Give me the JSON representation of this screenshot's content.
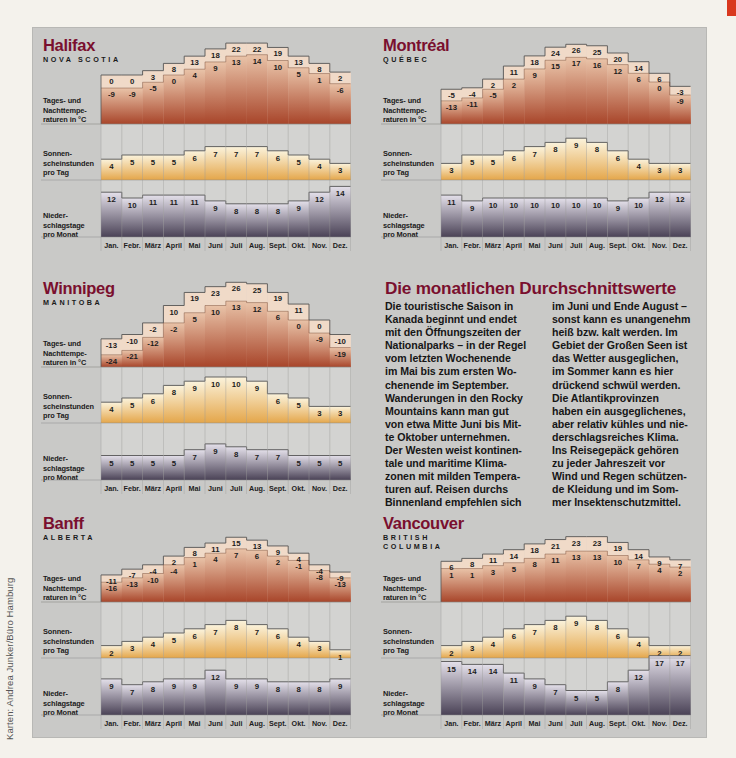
{
  "credit": "Karten: Andrea Junker/Büro Hamburg",
  "colors": {
    "city_title": "#7a0f2e",
    "panel_bg": "#c9c9c7",
    "temp_band_light": "#f0dac8",
    "temp_band_dark": "#a8452a",
    "sun_light": "#fbf3dc",
    "sun_dark": "#e4a64a",
    "rain_light": "#e4e0ea",
    "rain_dark": "#4a4256",
    "corner_mark": "#d9381e"
  },
  "row_labels": {
    "temp": "Tages- und\nNachttempe-\nraturen in °C",
    "sun": "Sonnen-\nscheinstunden\npro Tag",
    "rain": "Nieder-\nschlagstage\npro Monat"
  },
  "months": [
    "Jan.",
    "Febr.",
    "März",
    "April",
    "Mai",
    "Juni",
    "Juli",
    "Aug.",
    "Sept.",
    "Okt.",
    "Nov.",
    "Dez."
  ],
  "article": {
    "title": "Die monatlichen Durchschnittswerte",
    "col1": "Die touristische Saison in\nKanada beginnt und endet\nmit den Öffnungszeiten der\nNationalparks – in der Regel\nvom letzten Wochenende\nim Mai bis zum ersten Wo-\nchenende im September.\nWanderungen in den Rocky\nMountains kann man gut\nvon etwa Mitte Juni bis Mit-\nte Oktober unternehmen.\nDer Westen weist kontinen-\ntale und maritime Klima-\nzonen mit milden Tempera-\nturen auf. Reisen durchs\nBinnenland empfehlen sich",
    "col2": "im Juni und Ende August –\nsonst kann es unangenehm\nheiß bzw. kalt werden. Im\nGebiet der Großen Seen ist\ndas Wetter ausgeglichen,\nim Sommer kann es hier\ndrückend schwül werden.\nDie Atlantikprovinzen\nhaben ein ausgeglichenes,\naber relativ kühles und nie-\nderschlagsreiches Klima.\nIns Reisegepäck gehören\nzu jeder Jahreszeit vor\nWind und Regen schützen-\nde Kleidung und im Som-\nmer Insektenschutzmittel."
  },
  "chart_data": [
    {
      "type": "bar",
      "title": "Halifax",
      "subtitle": "NOVA SCOTIA",
      "categories": [
        "Jan.",
        "Febr.",
        "März",
        "April",
        "Mai",
        "Juni",
        "Juli",
        "Aug.",
        "Sept.",
        "Okt.",
        "Nov.",
        "Dez."
      ],
      "series": [
        {
          "name": "Tagestemperatur °C",
          "values": [
            0,
            0,
            3,
            8,
            13,
            18,
            22,
            22,
            19,
            13,
            8,
            2
          ]
        },
        {
          "name": "Nachttemperatur °C",
          "values": [
            -9,
            -9,
            -5,
            0,
            4,
            9,
            13,
            14,
            10,
            5,
            1,
            -6
          ]
        },
        {
          "name": "Sonnenscheinstunden pro Tag",
          "values": [
            4,
            5,
            5,
            5,
            6,
            7,
            7,
            7,
            6,
            5,
            4,
            3
          ]
        },
        {
          "name": "Niederschlagstage pro Monat",
          "values": [
            12,
            10,
            11,
            11,
            11,
            9,
            8,
            8,
            8,
            9,
            12,
            14
          ]
        }
      ]
    },
    {
      "type": "bar",
      "title": "Montréal",
      "subtitle": "QUÉBEC",
      "categories": [
        "Jan.",
        "Febr.",
        "März",
        "April",
        "Mai",
        "Juni",
        "Juli",
        "Aug.",
        "Sept.",
        "Okt.",
        "Nov.",
        "Dez."
      ],
      "series": [
        {
          "name": "Tagestemperatur °C",
          "values": [
            -5,
            -4,
            2,
            11,
            18,
            24,
            26,
            25,
            20,
            14,
            6,
            -3
          ]
        },
        {
          "name": "Nachttemperatur °C",
          "values": [
            -13,
            -11,
            -5,
            2,
            9,
            15,
            17,
            16,
            12,
            6,
            0,
            -9
          ]
        },
        {
          "name": "Sonnenscheinstunden pro Tag",
          "values": [
            3,
            5,
            5,
            6,
            7,
            8,
            9,
            8,
            6,
            4,
            3,
            3
          ]
        },
        {
          "name": "Niederschlagstage pro Monat",
          "values": [
            11,
            9,
            10,
            10,
            10,
            10,
            10,
            10,
            9,
            10,
            12,
            12
          ]
        }
      ]
    },
    {
      "type": "bar",
      "title": "Winnipeg",
      "subtitle": "MANITOBA",
      "categories": [
        "Jan.",
        "Febr.",
        "März",
        "April",
        "Mai",
        "Juni",
        "Juli",
        "Aug.",
        "Sept.",
        "Okt.",
        "Nov.",
        "Dez."
      ],
      "series": [
        {
          "name": "Tagestemperatur °C",
          "values": [
            -13,
            -10,
            -2,
            10,
            19,
            23,
            26,
            25,
            19,
            11,
            0,
            -10
          ]
        },
        {
          "name": "Nachttemperatur °C",
          "values": [
            -24,
            -21,
            -12,
            -2,
            5,
            10,
            13,
            12,
            6,
            0,
            -9,
            -19
          ]
        },
        {
          "name": "Sonnenscheinstunden pro Tag",
          "values": [
            4,
            5,
            6,
            8,
            9,
            10,
            10,
            9,
            6,
            5,
            3,
            3
          ]
        },
        {
          "name": "Niederschlagstage pro Monat",
          "values": [
            5,
            5,
            5,
            5,
            7,
            9,
            8,
            7,
            7,
            5,
            5,
            5
          ]
        }
      ]
    },
    {
      "type": "bar",
      "title": "Banff",
      "subtitle": "ALBERTA",
      "categories": [
        "Jan.",
        "Febr.",
        "März",
        "April",
        "Mai",
        "Juni",
        "Juli",
        "Aug.",
        "Sept.",
        "Okt.",
        "Nov.",
        "Dez."
      ],
      "series": [
        {
          "name": "Tagestemperatur °C",
          "values": [
            -11,
            -7,
            -4,
            2,
            8,
            11,
            15,
            13,
            9,
            4,
            -4,
            -9
          ]
        },
        {
          "name": "Nachttemperatur °C",
          "values": [
            -16,
            -13,
            -10,
            -4,
            1,
            4,
            7,
            6,
            2,
            -1,
            -8,
            -13
          ]
        },
        {
          "name": "Sonnenscheinstunden pro Tag",
          "values": [
            2,
            3,
            4,
            5,
            6,
            7,
            8,
            7,
            6,
            4,
            3,
            1
          ]
        },
        {
          "name": "Niederschlagstage pro Monat",
          "values": [
            9,
            7,
            8,
            9,
            9,
            12,
            9,
            9,
            8,
            8,
            8,
            9
          ]
        }
      ]
    },
    {
      "type": "bar",
      "title": "Vancouver",
      "subtitle": "BRITISH COLUMBIA",
      "categories": [
        "Jan.",
        "Febr.",
        "März",
        "April",
        "Mai",
        "Juni",
        "Juli",
        "Aug.",
        "Sept.",
        "Okt.",
        "Nov.",
        "Dez."
      ],
      "series": [
        {
          "name": "Tagestemperatur °C",
          "values": [
            6,
            8,
            11,
            14,
            18,
            21,
            23,
            23,
            19,
            14,
            9,
            7
          ]
        },
        {
          "name": "Nachttemperatur °C",
          "values": [
            1,
            1,
            3,
            5,
            8,
            11,
            13,
            13,
            10,
            7,
            4,
            2
          ]
        },
        {
          "name": "Sonnenscheinstunden pro Tag",
          "values": [
            2,
            3,
            4,
            6,
            7,
            8,
            9,
            8,
            6,
            4,
            2,
            2
          ]
        },
        {
          "name": "Niederschlagstage pro Monat",
          "values": [
            15,
            14,
            14,
            11,
            9,
            7,
            5,
            5,
            8,
            12,
            17,
            17
          ]
        }
      ]
    }
  ],
  "cities": [
    {
      "key": "halifax",
      "name": "Halifax",
      "region": "NOVA SCOTIA",
      "day": [
        0,
        0,
        3,
        8,
        13,
        18,
        22,
        22,
        19,
        13,
        8,
        2
      ],
      "night": [
        -9,
        -9,
        -5,
        0,
        4,
        9,
        13,
        14,
        10,
        5,
        1,
        -6
      ],
      "sun": [
        4,
        5,
        5,
        5,
        6,
        7,
        7,
        7,
        6,
        5,
        4,
        3
      ],
      "rain": [
        12,
        10,
        11,
        11,
        11,
        9,
        8,
        8,
        8,
        9,
        12,
        14
      ]
    },
    {
      "key": "montreal",
      "name": "Montréal",
      "region": "QUÉBEC",
      "day": [
        -5,
        -4,
        2,
        11,
        18,
        24,
        26,
        25,
        20,
        14,
        6,
        -3
      ],
      "night": [
        -13,
        -11,
        -5,
        2,
        9,
        15,
        17,
        16,
        12,
        6,
        0,
        -9
      ],
      "sun": [
        3,
        5,
        5,
        6,
        7,
        8,
        9,
        8,
        6,
        4,
        3,
        3
      ],
      "rain": [
        11,
        9,
        10,
        10,
        10,
        10,
        10,
        10,
        9,
        10,
        12,
        12
      ]
    },
    {
      "key": "winnipeg",
      "name": "Winnipeg",
      "region": "MANITOBA",
      "day": [
        -13,
        -10,
        -2,
        10,
        19,
        23,
        26,
        25,
        19,
        11,
        0,
        -10
      ],
      "night": [
        -24,
        -21,
        -12,
        -2,
        5,
        10,
        13,
        12,
        6,
        0,
        -9,
        -19
      ],
      "sun": [
        4,
        5,
        6,
        8,
        9,
        10,
        10,
        9,
        6,
        5,
        3,
        3
      ],
      "rain": [
        5,
        5,
        5,
        5,
        7,
        9,
        8,
        7,
        7,
        5,
        5,
        5
      ]
    },
    {
      "key": "banff",
      "name": "Banff",
      "region": "ALBERTA",
      "day": [
        -11,
        -7,
        -4,
        2,
        8,
        11,
        15,
        13,
        9,
        4,
        -4,
        -9
      ],
      "night": [
        -16,
        -13,
        -10,
        -4,
        1,
        4,
        7,
        6,
        2,
        -1,
        -8,
        -13
      ],
      "sun": [
        2,
        3,
        4,
        5,
        6,
        7,
        8,
        7,
        6,
        4,
        3,
        1
      ],
      "rain": [
        9,
        7,
        8,
        9,
        9,
        12,
        9,
        9,
        8,
        8,
        8,
        9
      ]
    },
    {
      "key": "vancouver",
      "name": "Vancouver",
      "region": "BRITISH\nCOLUMBIA",
      "day": [
        6,
        8,
        11,
        14,
        18,
        21,
        23,
        23,
        19,
        14,
        9,
        7
      ],
      "night": [
        1,
        1,
        3,
        5,
        8,
        11,
        13,
        13,
        10,
        7,
        4,
        2
      ],
      "sun": [
        2,
        3,
        4,
        6,
        7,
        8,
        9,
        8,
        6,
        4,
        2,
        2
      ],
      "rain": [
        15,
        14,
        14,
        11,
        9,
        7,
        5,
        5,
        8,
        12,
        17,
        17
      ]
    }
  ]
}
